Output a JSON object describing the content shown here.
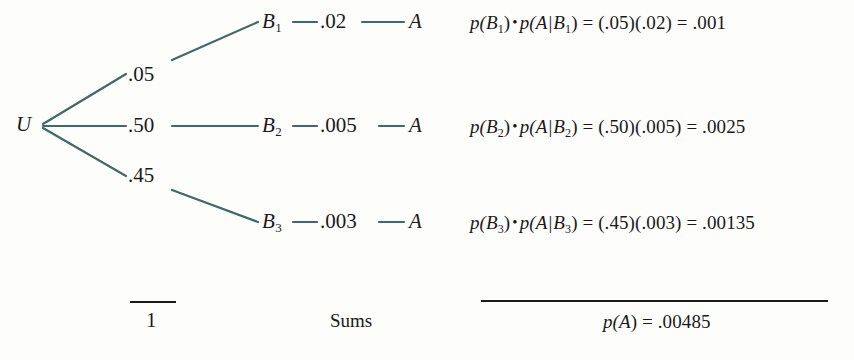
{
  "diagram": {
    "type": "probability-tree",
    "line_color": "#3f6b66",
    "text_color": "#1a1a1a",
    "background": "#fdfdfc"
  },
  "root": {
    "label": "U"
  },
  "branches": [
    {
      "prior": ".05",
      "node": "B",
      "node_sub": "1",
      "conditional": ".02",
      "outcome": "A"
    },
    {
      "prior": ".50",
      "node": "B",
      "node_sub": "2",
      "conditional": ".005",
      "outcome": "A"
    },
    {
      "prior": ".45",
      "node": "B",
      "node_sub": "3",
      "conditional": ".003",
      "outcome": "A"
    }
  ],
  "equations": [
    {
      "p_open": "p(",
      "b": "B",
      "b_sub": "1",
      "p_close": ")",
      "dot": "•",
      "cond_open": "p(",
      "cond_a": "A",
      "cond_bar": "|",
      "cond_b": "B",
      "cond_b_sub": "1",
      "cond_close": ")",
      "equals": "=",
      "factor1": "(.05)",
      "factor2": "(.02)",
      "equals2": "=",
      "result": ".001"
    },
    {
      "p_open": "p(",
      "b": "B",
      "b_sub": "2",
      "p_close": ")",
      "dot": "•",
      "cond_open": "p(",
      "cond_a": "A",
      "cond_bar": "|",
      "cond_b": "B",
      "cond_b_sub": "2",
      "cond_close": ")",
      "equals": "=",
      "factor1": "(.50)",
      "factor2": "(.005)",
      "equals2": "=",
      "result": ".0025"
    },
    {
      "p_open": "p(",
      "b": "B",
      "b_sub": "3",
      "p_close": ")",
      "dot": "•",
      "cond_open": "p(",
      "cond_a": "A",
      "cond_bar": "|",
      "cond_b": "B",
      "cond_b_sub": "3",
      "cond_close": ")",
      "equals": "=",
      "factor1": "(.45)",
      "factor2": "(.003)",
      "equals2": "=",
      "result": ".00135"
    }
  ],
  "footer": {
    "prior_sum": "1",
    "sums_label": "Sums",
    "total_p_open": "p(",
    "total_a": "A",
    "total_close": ")",
    "total_equals": "=",
    "total_value": ".00485"
  }
}
